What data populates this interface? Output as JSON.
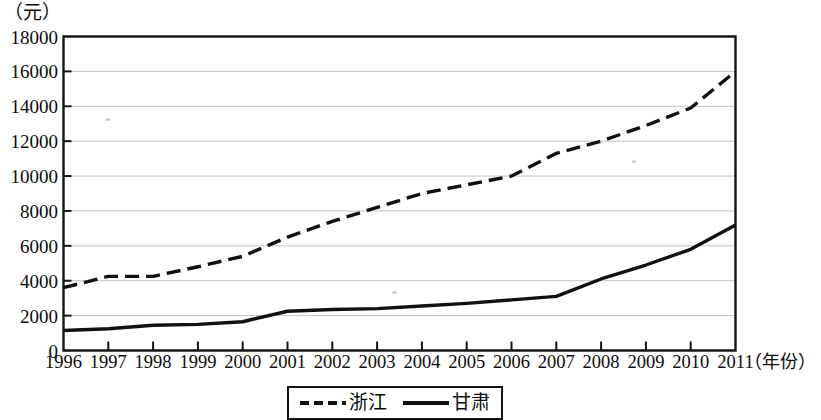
{
  "chart_data": {
    "type": "line",
    "title": "",
    "subtitle": "",
    "xlabel": "（年份）",
    "ylabel": "（元）",
    "categories": [
      "1996",
      "1997",
      "1998",
      "1999",
      "2000",
      "2001",
      "2002",
      "2003",
      "2004",
      "2005",
      "2006",
      "2007",
      "2008",
      "2009",
      "2010",
      "2011"
    ],
    "x": [
      1996,
      1997,
      1998,
      1999,
      2000,
      2001,
      2002,
      2003,
      2004,
      2005,
      2006,
      2007,
      2008,
      2009,
      2010,
      2011
    ],
    "xlim": [
      1996,
      2011
    ],
    "ylim": [
      0,
      18000
    ],
    "y_ticks": [
      0,
      2000,
      4000,
      6000,
      8000,
      10000,
      12000,
      14000,
      16000,
      18000
    ],
    "y_tick_labels": [
      "0",
      "2000",
      "4000",
      "6000",
      "8000",
      "10000",
      "12000",
      "14000",
      "16000",
      "18000"
    ],
    "grid": true,
    "grid_axis": "y",
    "legend_position": "bottom",
    "series": [
      {
        "name": "浙江",
        "style": "dashed",
        "color": "#111111",
        "values": [
          3600,
          4250,
          4250,
          4800,
          5400,
          6500,
          7400,
          8200,
          9000,
          9500,
          10000,
          11300,
          12000,
          12900,
          13900,
          16000
        ]
      },
      {
        "name": "甘肃",
        "style": "solid",
        "color": "#111111",
        "values": [
          1150,
          1250,
          1450,
          1500,
          1650,
          2250,
          2350,
          2400,
          2550,
          2700,
          2900,
          3100,
          4100,
          4900,
          5800,
          7200
        ]
      }
    ],
    "legend": [
      {
        "label": "浙江",
        "style": "dashed"
      },
      {
        "label": "甘肃",
        "style": "solid"
      }
    ]
  },
  "axes": {
    "y_unit": "（元）",
    "x_unit": "（年份）"
  }
}
